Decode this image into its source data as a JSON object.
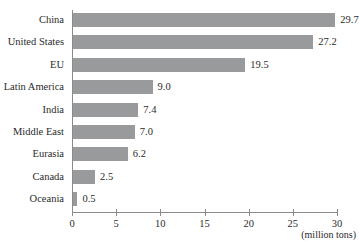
{
  "chart_data": {
    "type": "bar",
    "orientation": "horizontal",
    "title": "",
    "xlabel": "(million tons)",
    "ylabel": "",
    "categories": [
      "China",
      "United States",
      "EU",
      "Latin America",
      "India",
      "Middle East",
      "Eurasia",
      "Canada",
      "Oceania"
    ],
    "values": [
      29.7,
      27.2,
      19.5,
      9.0,
      7.4,
      7.0,
      6.2,
      2.5,
      0.5
    ],
    "value_labels": [
      "29.7",
      "27.2",
      "19.5",
      "9.0",
      "7.4",
      "7.0",
      "6.2",
      "2.5",
      "0.5"
    ],
    "xlim": [
      0,
      30
    ],
    "xticks": [
      0,
      5,
      10,
      15,
      20,
      25,
      30
    ],
    "xtick_labels": [
      "0",
      "5",
      "10",
      "15",
      "20",
      "25",
      "30"
    ],
    "grid": false,
    "legend": false,
    "bar_color": "#999a9c",
    "axis_color": "#8a8a8c",
    "text_color": "#2b2b2b"
  }
}
